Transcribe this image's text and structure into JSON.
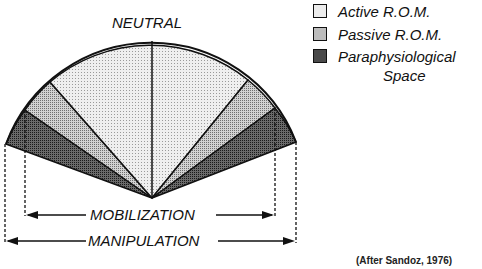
{
  "diagram": {
    "title": "NEUTRAL",
    "legend": [
      {
        "label": "Active R.O.M.",
        "fill": "#e6e6e6"
      },
      {
        "label": "Passive R.O.M.",
        "fill": "#bdbdbd"
      },
      {
        "label": "Paraphysiological",
        "label2": "Space",
        "fill": "#555555"
      }
    ],
    "ranges": {
      "mobilization": "MOBILIZATION",
      "manipulation": "MANIPULATION"
    },
    "citation": "(After Sandoz, 1976)",
    "colors": {
      "active": "#e6e6e6",
      "passive": "#bdbdbd",
      "paraphysiological": "#555555",
      "stroke": "#111111"
    }
  }
}
